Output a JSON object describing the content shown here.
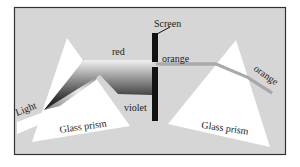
{
  "diagram": {
    "colors": {
      "background": "#d6d6d6",
      "frame": "#333333",
      "prism": "#ffffff",
      "screen": "#111111",
      "orange_beam": "#a9a9a9"
    },
    "labels": {
      "light": "Light",
      "red": "red",
      "violet": "violet",
      "screen": "Screen",
      "orange_left": "orange",
      "orange_right": "orange",
      "prism_left": "Glass prism",
      "prism_right": "Glass prism"
    }
  }
}
